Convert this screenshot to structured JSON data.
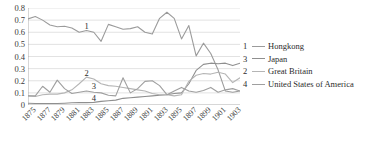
{
  "chart_data": {
    "type": "line",
    "title": "",
    "xlabel": "",
    "ylabel": "",
    "ylim": [
      0,
      0.8
    ],
    "ytick_values": [
      0.8,
      0.7,
      0.6,
      0.5,
      0.4,
      0.3,
      0.2,
      0.1,
      0
    ],
    "ytick_labels": [
      "0.8",
      "0.7",
      "0.6",
      "0.5",
      "0.4",
      "0.3",
      "0.2",
      "0.1",
      "0"
    ],
    "grid": true,
    "legend_position": "right",
    "x": [
      1875,
      1876,
      1877,
      1878,
      1879,
      1880,
      1881,
      1882,
      1883,
      1884,
      1885,
      1886,
      1887,
      1888,
      1889,
      1890,
      1891,
      1892,
      1893,
      1894,
      1895,
      1896,
      1897,
      1898,
      1899,
      1900,
      1901,
      1902,
      1903,
      1904
    ],
    "xtick_labels": [
      "1875",
      "1877",
      "1879",
      "1881",
      "1883",
      "1885",
      "1887",
      "1889",
      "1891",
      "1893",
      "1895",
      "1897",
      "1899",
      "1901",
      "1903"
    ],
    "series": [
      {
        "key": "1",
        "name": "Hongkong",
        "color": "#9b9b9b",
        "values": [
          0.71,
          0.73,
          0.7,
          0.66,
          0.645,
          0.65,
          0.635,
          0.6,
          0.615,
          0.6,
          0.525,
          0.665,
          0.645,
          0.625,
          0.63,
          0.645,
          0.6,
          0.585,
          0.715,
          0.765,
          0.715,
          0.545,
          0.655,
          0.405,
          0.51,
          0.425,
          0.29,
          0.115,
          0.105,
          0.115
        ]
      },
      {
        "key": "3",
        "name": "Japan",
        "color": "#8f8f8f",
        "values": [
          0.015,
          0.012,
          0.012,
          0.012,
          0.012,
          0.015,
          0.018,
          0.02,
          0.02,
          0.022,
          0.03,
          0.035,
          0.04,
          0.055,
          0.06,
          0.065,
          0.07,
          0.075,
          0.08,
          0.085,
          0.095,
          0.1,
          0.175,
          0.285,
          0.335,
          0.345,
          0.34,
          0.345,
          0.325,
          0.345
        ]
      },
      {
        "key": "2",
        "name": "Great Britain",
        "color": "#b5b5b5",
        "values": [
          0.075,
          0.07,
          0.085,
          0.09,
          0.09,
          0.1,
          0.125,
          0.175,
          0.23,
          0.215,
          0.175,
          0.16,
          0.155,
          0.145,
          0.135,
          0.125,
          0.115,
          0.095,
          0.085,
          0.085,
          0.075,
          0.085,
          0.195,
          0.245,
          0.26,
          0.255,
          0.27,
          0.255,
          0.185,
          0.225
        ]
      },
      {
        "key": "4",
        "name": "United States of America",
        "color": "#9f9f9f",
        "values": [
          0.075,
          0.075,
          0.155,
          0.105,
          0.205,
          0.135,
          0.095,
          0.105,
          0.115,
          0.105,
          0.1,
          0.08,
          0.075,
          0.225,
          0.1,
          0.135,
          0.195,
          0.2,
          0.16,
          0.085,
          0.115,
          0.145,
          0.115,
          0.105,
          0.12,
          0.145,
          0.105,
          0.125,
          0.135,
          0.115
        ]
      }
    ],
    "annotations": [
      {
        "text": "1",
        "x": 1883,
        "y": 0.655
      },
      {
        "text": "2",
        "x": 1883,
        "y": 0.265
      },
      {
        "text": "3",
        "x": 1884,
        "y": 0.155
      },
      {
        "text": "4",
        "x": 1884,
        "y": 0.055
      }
    ]
  },
  "legend": {
    "entries": [
      {
        "key": "1",
        "label": "Hongkong"
      },
      {
        "key": "3",
        "label": "Japan"
      },
      {
        "key": "2",
        "label": "Great Britain"
      },
      {
        "key": "4",
        "label": "United States of America"
      }
    ]
  }
}
